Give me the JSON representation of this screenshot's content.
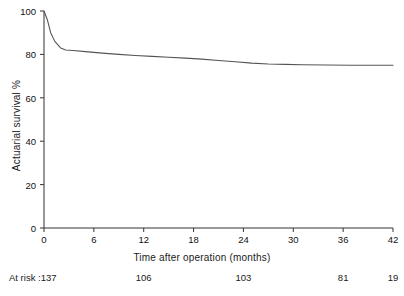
{
  "chart_data": {
    "type": "line",
    "title": "",
    "subtitle": "",
    "xlabel": "Time after operation (months)",
    "ylabel": "Actuarial survival %",
    "xlim": [
      0,
      42
    ],
    "ylim": [
      0,
      100
    ],
    "xticks": [
      0,
      6,
      12,
      18,
      24,
      30,
      36,
      42
    ],
    "xtick_labels": [
      "0",
      "6",
      "12",
      "18",
      "24",
      "30",
      "36",
      "42"
    ],
    "yticks": [
      0,
      20,
      40,
      60,
      80,
      100
    ],
    "ytick_labels": [
      "0",
      "20",
      "40",
      "60",
      "80",
      "100"
    ],
    "grid": false,
    "legend": null,
    "line_color": "#555555",
    "series": [
      {
        "name": "Actuarial survival",
        "x": [
          0,
          0.4,
          0.8,
          1.3,
          2.0,
          2.6,
          3.5,
          5.0,
          7.0,
          9.0,
          11.0,
          13.0,
          15.0,
          17.0,
          19.0,
          21.0,
          23.0,
          25.0,
          27.0,
          29.0,
          31.0,
          34.0,
          37.0,
          40.0,
          42.0
        ],
        "y": [
          100,
          96,
          90,
          86,
          83,
          82,
          81.8,
          81.3,
          80.6,
          80.0,
          79.5,
          79.1,
          78.7,
          78.3,
          77.8,
          77.2,
          76.6,
          76.0,
          75.6,
          75.4,
          75.2,
          75.1,
          75.0,
          75.0,
          75.0
        ]
      }
    ],
    "at_risk": {
      "label": "At risk :",
      "times": [
        0,
        12,
        24,
        36,
        42
      ],
      "counts": [
        "137",
        "106",
        "103",
        "81",
        "19"
      ]
    }
  }
}
